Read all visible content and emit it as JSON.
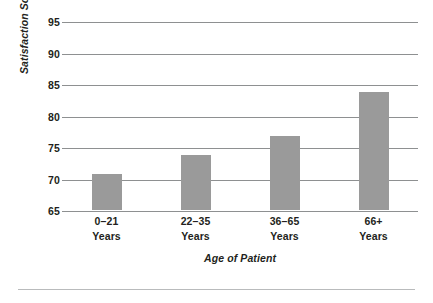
{
  "chart_data": {
    "type": "bar",
    "title": "",
    "categories": [
      "0–21\nYears",
      "22–35\nYears",
      "36–65\nYears",
      "66+\nYears"
    ],
    "category_lines": [
      [
        "0–21",
        "Years"
      ],
      [
        "22–35",
        "Years"
      ],
      [
        "36–65",
        "Years"
      ],
      [
        "66+",
        "Years"
      ]
    ],
    "values": [
      70.7,
      73.8,
      76.8,
      83.8
    ],
    "xlabel": "Age of Patient",
    "ylabel": "Satisfaction Score",
    "ylim": [
      65,
      95
    ],
    "yticks": [
      95,
      90,
      85,
      80,
      75,
      70,
      65
    ],
    "ytick_labels": [
      "95",
      "90",
      "85",
      "80",
      "75",
      "70",
      "65"
    ],
    "grid": true,
    "legend": false,
    "bar_color": "#9a9a9a",
    "gridline_color": "#8e9091",
    "text_color": "#231f20"
  }
}
